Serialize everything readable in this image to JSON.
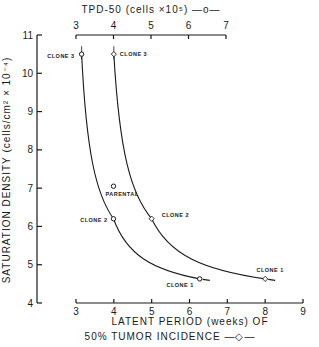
{
  "chart_data": {
    "type": "line",
    "title": "",
    "ylabel": "SATURATION  DENSITY  (cells/cm² × 10⁻⁴)",
    "ylim": [
      4,
      11
    ],
    "yticks": [
      "4",
      "5",
      "6",
      "7",
      "8",
      "9",
      "10",
      "11"
    ],
    "top_axis": {
      "label": "TPD-50 (cells ×10⁵) —o—",
      "range": [
        3,
        7
      ],
      "ticks": [
        "3",
        "4",
        "5",
        "6",
        "7"
      ]
    },
    "bottom_axis": {
      "label_line1": "LATENT  PERIOD  (weeks)  OF",
      "label_line2": "50%  TUMOR  INCIDENCE    —◇—",
      "range": [
        3,
        9
      ],
      "ticks": [
        "3",
        "4",
        "5",
        "6",
        "7",
        "8",
        "9"
      ]
    },
    "series": [
      {
        "name": "TPD-50",
        "marker": "circle",
        "axis": "top",
        "points": [
          {
            "label": "CLONE 3",
            "x": 3.15,
            "y": 10.5
          },
          {
            "label": "PARENTAL",
            "x": 4.0,
            "y": 7.05
          },
          {
            "label": "CLONE 2",
            "x": 4.0,
            "y": 6.2
          },
          {
            "label": "CLONE 1",
            "x": 6.3,
            "y": 4.63
          }
        ]
      },
      {
        "name": "Latent period of 50% tumor incidence",
        "marker": "diamond",
        "axis": "bottom",
        "points": [
          {
            "label": "CLONE 3",
            "x": 4.0,
            "y": 10.5
          },
          {
            "label": "CLONE 2",
            "x": 5.0,
            "y": 6.2
          },
          {
            "label": "CLONE 1",
            "x": 8.0,
            "y": 4.63
          }
        ]
      }
    ]
  }
}
